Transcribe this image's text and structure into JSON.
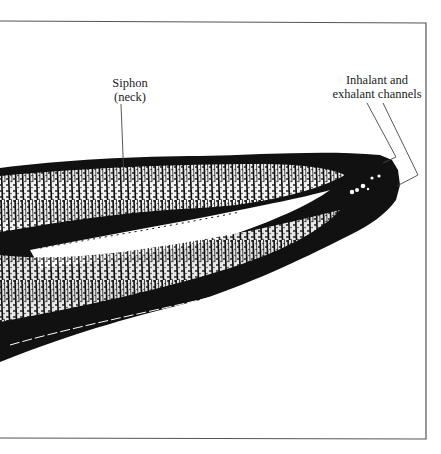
{
  "figure": {
    "labels": [
      {
        "id": "siphon",
        "lines": [
          "Siphon",
          "(neck)"
        ]
      },
      {
        "id": "channels",
        "lines": [
          "Inhalant and",
          "exhalant channels"
        ]
      }
    ]
  },
  "colors": {
    "ink": "#111111",
    "background": "#ffffff",
    "border": "#555555"
  }
}
